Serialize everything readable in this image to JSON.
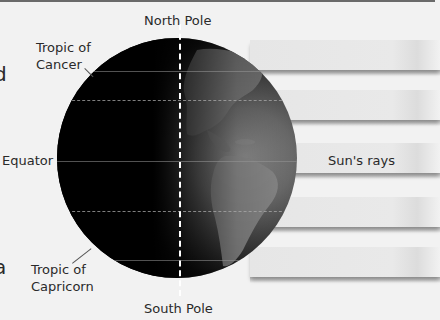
{
  "diagram": {
    "labels": {
      "north_pole": "North Pole",
      "south_pole": "South Pole",
      "tropic_cancer_line1": "Tropic of",
      "tropic_cancer_line2": "Cancer",
      "equator": "Equator",
      "tropic_capricorn_line1": "Tropic of",
      "tropic_capricorn_line2": "Capricorn",
      "suns_rays": "Sun's rays"
    },
    "edge_fragments": {
      "top_left": "d",
      "bottom_left": "a"
    },
    "rays": {
      "count": 5,
      "direction": "from right"
    },
    "colors": {
      "background": "#f2f2f2",
      "globe_dark": "#000000",
      "globe_lit": "#8e8e8e",
      "ray": "#e6e6e6",
      "axis": "#ffffff",
      "text": "#2a2a2a"
    }
  }
}
